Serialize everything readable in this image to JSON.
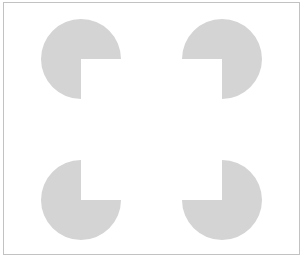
{
  "figure": {
    "name": "Kanizsa square illusion",
    "background_color": "#ffffff",
    "frame_color": "#c2c2c2",
    "shape_color": "#d4d4d4",
    "canvas": {
      "width": 303,
      "height": 264
    },
    "frame": {
      "x": 3,
      "y": 2,
      "width": 296,
      "height": 252
    },
    "pacmen": [
      {
        "id": "top-left",
        "cx": 81,
        "cy": 59,
        "r": 40,
        "missing_quadrant": "bottom-right"
      },
      {
        "id": "top-right",
        "cx": 222,
        "cy": 59,
        "r": 40,
        "missing_quadrant": "bottom-left"
      },
      {
        "id": "bottom-left",
        "cx": 81,
        "cy": 200,
        "r": 40,
        "missing_quadrant": "top-right"
      },
      {
        "id": "bottom-right",
        "cx": 222,
        "cy": 200,
        "r": 40,
        "missing_quadrant": "top-left"
      }
    ]
  }
}
